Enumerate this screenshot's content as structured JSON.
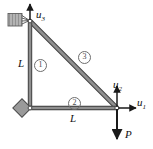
{
  "figure": {
    "type": "truss-free-body-diagram",
    "colors": {
      "member_fill": "#8f8f8f",
      "member_stroke": "#3a3a3a",
      "support_fill": "#9a9a9a",
      "support_stroke": "#4a4a4a",
      "arrow": "#1a1a1a",
      "circle_label": "#6d6d6d",
      "background": "#ffffff"
    },
    "nodes": [
      {
        "name": "top-node",
        "x": 30,
        "y": 21
      },
      {
        "name": "bottom-left-node",
        "x": 30,
        "y": 108
      },
      {
        "name": "bottom-right-node",
        "x": 117,
        "y": 108
      }
    ],
    "members": [
      {
        "id": "1",
        "label": "①",
        "from": "top-node",
        "to": "bottom-left-node",
        "length_label": "L"
      },
      {
        "id": "2",
        "label": "②",
        "from": "bottom-left-node",
        "to": "bottom-right-node",
        "length_label": "L"
      },
      {
        "id": "3",
        "label": "③",
        "from": "top-node",
        "to": "bottom-right-node",
        "length_label": ""
      }
    ],
    "dimension_labels": {
      "vertical": "L",
      "horizontal": "L"
    },
    "dof_arrows": [
      {
        "name": "u1",
        "label": "u",
        "subscript": "1",
        "direction": "right",
        "at_node": "bottom-right-node"
      },
      {
        "name": "u2",
        "label": "u",
        "subscript": "2",
        "direction": "up",
        "at_node": "bottom-right-node"
      },
      {
        "name": "u3",
        "label": "u",
        "subscript": "3",
        "direction": "up",
        "at_node": "top-node"
      }
    ],
    "load": {
      "name": "applied-load",
      "label": "P",
      "direction": "down",
      "at_node": "bottom-right-node"
    },
    "supports": [
      {
        "name": "top-left-support",
        "type": "hatched-roller-block"
      },
      {
        "name": "bottom-left-support",
        "type": "pin-diamond"
      }
    ]
  }
}
